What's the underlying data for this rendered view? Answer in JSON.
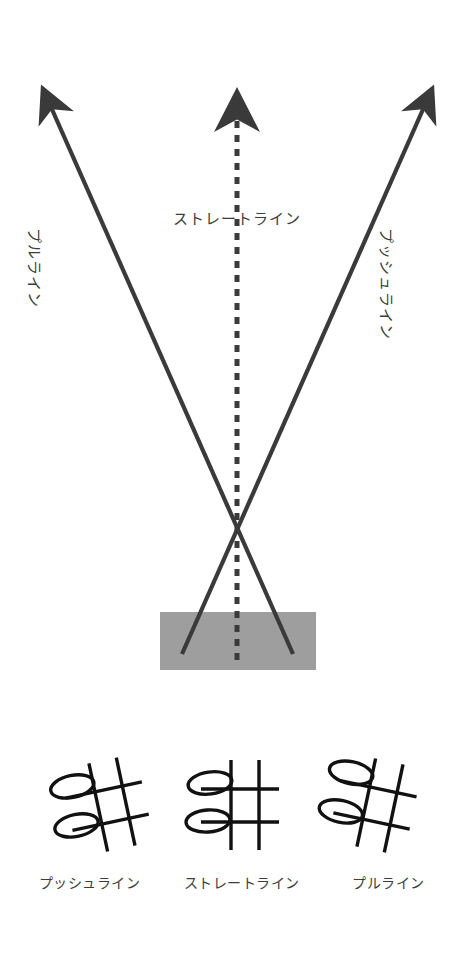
{
  "figure": {
    "background_color": "#ffffff",
    "line_color": "#3a3a3a",
    "rail_color": "#9e9e9e",
    "text_color": "#3c3c3c"
  },
  "main_diagram": {
    "rail": {
      "name": "cushion-rail",
      "x": 160,
      "y": 612,
      "width": 156,
      "height": 58,
      "color": "#9e9e9e"
    },
    "cross_point": {
      "x": 237,
      "y": 538
    },
    "arrows": [
      {
        "id": "pull-line",
        "label": "プルライン",
        "style": "solid",
        "start": {
          "x": 293,
          "y": 656
        },
        "end": {
          "x": 35,
          "y": 72
        },
        "label_x": 46,
        "label_y": 228,
        "label_rotation": 90
      },
      {
        "id": "straight-line",
        "label": "ストレートライン",
        "style": "dashed",
        "start": {
          "x": 237,
          "y": 660
        },
        "end": {
          "x": 237,
          "y": 72
        },
        "label_x": 236,
        "label_y": 214,
        "label_rotation": 0
      },
      {
        "id": "push-line",
        "label": "プッシュライン",
        "style": "solid",
        "start": {
          "x": 182,
          "y": 656
        },
        "end": {
          "x": 440,
          "y": 72
        },
        "label_x": 398,
        "label_y": 228,
        "label_rotation": 90
      }
    ]
  },
  "bottom_diagrams": {
    "items": [
      {
        "id": "push-line-grid",
        "caption": "プッシュライン",
        "tilt_deg": -12
      },
      {
        "id": "straight-line-grid",
        "caption": "ストレートライン",
        "tilt_deg": 0
      },
      {
        "id": "pull-line-grid",
        "caption": "プルライン",
        "tilt_deg": 12
      }
    ]
  }
}
